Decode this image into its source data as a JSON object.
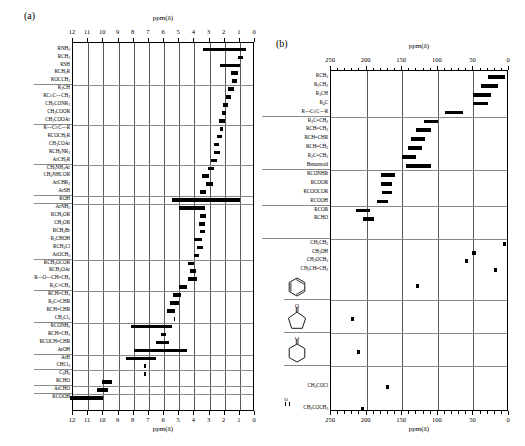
{
  "panel_a": {
    "letter": "(a)",
    "axis_title_top": "ppm(δ)",
    "axis_title_bottom": "ppm(δ)",
    "ticks": [
      "12",
      "11",
      "10",
      "9",
      "8",
      "7",
      "6",
      "5",
      "4",
      "3",
      "2",
      "1",
      "0"
    ],
    "axis_min": 0,
    "axis_max": 12,
    "rows": [
      {
        "label": "RNH<sub>2</sub>",
        "start": 0.6,
        "end": 3.4
      },
      {
        "label": "RCH<sub>3</sub>",
        "start": 0.8,
        "end": 1.1
      },
      {
        "label": "RSH",
        "start": 1.0,
        "end": 2.3
      },
      {
        "label": "RCH<sub>2</sub>R",
        "start": 1.1,
        "end": 1.6
      },
      {
        "label": "ROCCH<sub>3</sub>",
        "start": 1.2,
        "end": 1.5
      },
      {
        "label": "R<sub>3</sub>CH",
        "start": 1.4,
        "end": 1.8
      },
      {
        "label": "RC≡C—CH<sub>3</sub>",
        "start": 1.6,
        "end": 1.9
      },
      {
        "label": "CH<sub>3</sub>CONR<sub>2</sub>",
        "start": 1.8,
        "end": 2.1
      },
      {
        "label": "CH<sub>3</sub>COOR",
        "start": 1.9,
        "end": 2.2
      },
      {
        "label": "CH<sub>3</sub>COOAr",
        "start": 2.0,
        "end": 2.4
      },
      {
        "label": "R—C≡C—R",
        "start": 2.1,
        "end": 2.3
      },
      {
        "label": "RCOCH<sub>2</sub>R",
        "start": 2.2,
        "end": 2.5
      },
      {
        "label": "CH<sub>3</sub>COAr",
        "start": 2.4,
        "end": 2.7
      },
      {
        "label": "RCH<sub>2</sub>NR<sub>2</sub>",
        "start": 2.3,
        "end": 2.7
      },
      {
        "label": "ArCH<sub>2</sub>R",
        "start": 2.5,
        "end": 2.9
      },
      {
        "label": "CH<sub>2</sub>NH<sub>2</sub>Ar",
        "start": 2.7,
        "end": 3.1
      },
      {
        "label": "CH<sub>2</sub>NHCOR",
        "start": 3.0,
        "end": 3.5
      },
      {
        "label": "ArCHR<sub>2</sub>",
        "start": 2.8,
        "end": 3.2
      },
      {
        "label": "ArSH",
        "start": 3.2,
        "end": 3.6
      },
      {
        "label": "ROH",
        "start": 1.0,
        "end": 5.5
      },
      {
        "label": "ArNH<sub>2</sub>",
        "start": 3.3,
        "end": 5.0
      },
      {
        "label": "RCH<sub>2</sub>OR",
        "start": 3.2,
        "end": 3.6
      },
      {
        "label": "CH<sub>3</sub>OR",
        "start": 3.3,
        "end": 3.7
      },
      {
        "label": "RCH<sub>2</sub>Br",
        "start": 3.3,
        "end": 3.6
      },
      {
        "label": "R<sub>2</sub>CHOH",
        "start": 3.5,
        "end": 4.0
      },
      {
        "label": "RCH<sub>2</sub>Cl",
        "start": 3.4,
        "end": 3.8
      },
      {
        "label": "ArOCH<sub>3</sub>",
        "start": 3.7,
        "end": 4.0
      },
      {
        "label": "RCH<sub>2</sub>OCOR",
        "start": 4.0,
        "end": 4.4
      },
      {
        "label": "RCH<sub>2</sub>OAr",
        "start": 3.9,
        "end": 4.3
      },
      {
        "label": "R—O—CH=CH<sub>2</sub>",
        "start": 3.8,
        "end": 4.4
      },
      {
        "label": "R<sub>2</sub>C=CH<sub>2</sub>",
        "start": 4.5,
        "end": 5.0
      },
      {
        "label": "RCH=CH<sub>2</sub>",
        "start": 4.9,
        "end": 5.4
      },
      {
        "label": "R<sub>2</sub>C=CHR",
        "start": 5.0,
        "end": 5.6
      },
      {
        "label": "RCH=CHR",
        "start": 5.3,
        "end": 5.8
      },
      {
        "label": "CH<sub>2</sub>Cl<sub>2</sub>",
        "start": 5.25,
        "end": 5.35
      },
      {
        "label": "RCONH<sub>2</sub>",
        "start": 5.5,
        "end": 8.2
      },
      {
        "label": "RCH=CH<sub>2</sub>",
        "start": 5.9,
        "end": 6.2
      },
      {
        "label": "RCOCH=CHR",
        "start": 5.7,
        "end": 6.5
      },
      {
        "label": "ArOH",
        "start": 4.5,
        "end": 8.0
      },
      {
        "label": "ArH",
        "start": 6.5,
        "end": 8.5
      },
      {
        "label": "CHCl<sub>3</sub>",
        "start": 7.2,
        "end": 7.3
      },
      {
        "label": "C<sub>6</sub>H<sub>6</sub>",
        "start": 7.2,
        "end": 7.3
      },
      {
        "label": "RCHO",
        "start": 9.4,
        "end": 10.1
      },
      {
        "label": "ArCHO",
        "start": 9.7,
        "end": 10.4
      },
      {
        "label": "RCOOH",
        "start": 10.0,
        "end": 12.2
      }
    ]
  },
  "panel_b": {
    "letter": "(b)",
    "axis_title_top": "ppm(δ)",
    "axis_title_bottom": "ppm(δ)",
    "ticks": [
      "250",
      "200",
      "150",
      "100",
      "50",
      "0"
    ],
    "axis_min": 0,
    "axis_max": 250,
    "rows": [
      {
        "label": "RCH<sub>3</sub>",
        "start": 5,
        "end": 30
      },
      {
        "label": "R<sub>2</sub>CH<sub>2</sub>",
        "start": 15,
        "end": 40
      },
      {
        "label": "R<sub>3</sub>CH",
        "start": 25,
        "end": 50
      },
      {
        "label": "R<sub>4</sub>C",
        "start": 30,
        "end": 50
      },
      {
        "label": "R—C≡C—R",
        "start": 65,
        "end": 90
      },
      {
        "label": "R<sub>2</sub>C=CH<sub>2</sub>",
        "start": 100,
        "end": 120
      },
      {
        "label": "RCH=CH<sub>2</sub>",
        "start": 110,
        "end": 130
      },
      {
        "label": "RCH=CHR",
        "start": 118,
        "end": 138
      },
      {
        "label": "RCH=CH<sub>2</sub>",
        "start": 122,
        "end": 142
      },
      {
        "label": "R<sub>2</sub>C=CH<sub>2</sub>",
        "start": 130,
        "end": 150
      },
      {
        "label": "Benzenoid",
        "start": 110,
        "end": 145
      },
      {
        "label": "RCONHR",
        "start": 160,
        "end": 180
      },
      {
        "label": "RCOOR",
        "start": 165,
        "end": 180
      },
      {
        "label": "RCOOCOR",
        "start": 165,
        "end": 178
      },
      {
        "label": "RCOOH",
        "start": 170,
        "end": 185
      },
      {
        "label": "RCOR",
        "start": 195,
        "end": 215
      },
      {
        "label": "RCHO",
        "start": 190,
        "end": 205
      }
    ],
    "reference_rows": [
      {
        "label": "CH<sub>3</sub>CH<sub>3</sub>",
        "start": 4,
        "end": 9
      },
      {
        "label": "CH<sub>3</sub>OH",
        "start": 47,
        "end": 52
      },
      {
        "label": "CH<sub>3</sub>OCH<sub>3</sub>",
        "start": 58,
        "end": 62
      },
      {
        "label": "CH<sub>3</sub>CH=CH<sub>2</sub>",
        "start": 17,
        "end": 21
      }
    ],
    "structure_rows": [
      {
        "structure": "benzene",
        "label": "",
        "start": 126,
        "end": 130
      },
      {
        "structure": "cyclopentanone",
        "label": "",
        "start": 218,
        "end": 222
      },
      {
        "structure": "cyclohexanone",
        "label": "",
        "start": 209,
        "end": 213
      }
    ],
    "bottom_rows": [
      {
        "label": "CH<sub>3</sub>COCl",
        "start": 168,
        "end": 173
      },
      {
        "label": "CH<sub>3</sub>COCH<sub>3</sub>",
        "start": 204,
        "end": 208,
        "carbonyl_o": "O"
      }
    ]
  }
}
